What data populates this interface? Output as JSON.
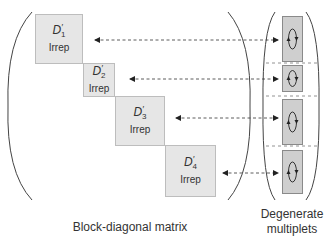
{
  "diagram": {
    "blocks": [
      {
        "symbol": "D",
        "subscript": "1",
        "prime": "′",
        "label": "Irrep"
      },
      {
        "symbol": "D",
        "subscript": "2",
        "prime": "′",
        "label": "Irrep"
      },
      {
        "symbol": "D",
        "subscript": "3",
        "prime": "′",
        "label": "Irrep"
      },
      {
        "symbol": "D",
        "subscript": "4",
        "prime": "′",
        "label": "Irrep"
      }
    ],
    "multiplets": [
      {
        "icon": "cycle-arrows-icon"
      },
      {
        "icon": "cycle-arrows-icon"
      },
      {
        "icon": "cycle-arrows-icon"
      },
      {
        "icon": "cycle-arrows-icon"
      }
    ],
    "captions": {
      "matrix": "Block-diagonal matrix",
      "multiplets_line1": "Degenerate",
      "multiplets_line2": "multiplets"
    },
    "colors": {
      "block_fill": "#e6e6e6",
      "multiplet_fill": "#cfcfcf",
      "line": "#444444"
    }
  }
}
